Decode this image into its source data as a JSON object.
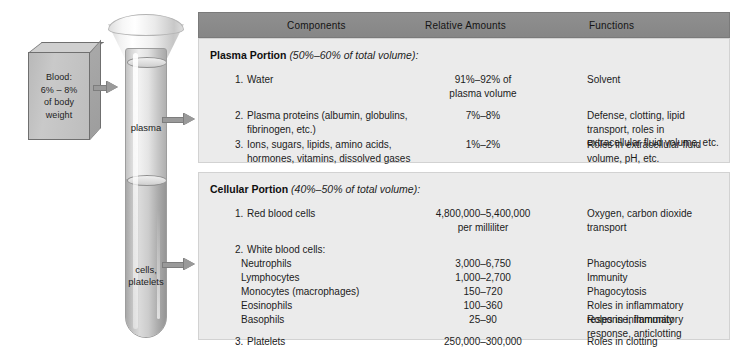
{
  "diagram": {
    "source_box": {
      "name": "blood-source-box",
      "lines": [
        "Blood:",
        "6% – 8%",
        "of body",
        "weight"
      ]
    },
    "tube": {
      "plasma_label": "plasma",
      "cells_label": "cells,\nplatelets"
    },
    "arrows": [
      "arrow-box-to-tube",
      "arrow-plasma-to-table",
      "arrow-cells-to-table"
    ]
  },
  "table": {
    "headers": [
      "Components",
      "Relative Amounts",
      "Functions"
    ],
    "sections": [
      {
        "title_bold": "Plasma Portion",
        "title_italic": "(50%–60% of total volume):",
        "rows": [
          {
            "number": "1.",
            "component": "Water",
            "amount": "91%–92% of\nplasma volume",
            "function": "Solvent"
          },
          {
            "number": "2.",
            "component": "Plasma proteins (albumin, globulins,\nfibrinogen, etc.)",
            "amount": "7%–8%",
            "function": "Defense, clotting, lipid transport, roles in\nextracellular fluid volume, etc."
          },
          {
            "number": "3.",
            "component": "Ions, sugars, lipids, amino acids,\nhormones, vitamins, dissolved gases",
            "amount": "1%–2%",
            "function": "Roles in extracellular fluid volume, pH, etc."
          }
        ]
      },
      {
        "title_bold": "Cellular Portion",
        "title_italic": "(40%–50% of total volume):",
        "rows": [
          {
            "number": "1.",
            "component": "Red blood cells",
            "amount": "4,800,000–5,400,000\nper milliliter",
            "function": "Oxygen, carbon dioxide transport"
          },
          {
            "number": "2.",
            "component": "White blood cells:",
            "amount": "",
            "function": ""
          },
          {
            "number": "",
            "component": "Neutrophils",
            "amount": "3,000–6,750",
            "function": "Phagocytosis",
            "indent": true
          },
          {
            "number": "",
            "component": "Lymphocytes",
            "amount": "1,000–2,700",
            "function": "Immunity",
            "indent": true
          },
          {
            "number": "",
            "component": "Monocytes (macrophages)",
            "amount": "150–720",
            "function": "Phagocytosis",
            "indent": true
          },
          {
            "number": "",
            "component": "Eosinophils",
            "amount": "100–360",
            "function": "Roles in inflammatory response, immunity",
            "indent": true
          },
          {
            "number": "",
            "component": "Basophils",
            "amount": "25–90",
            "function": "Roles in inflammatory response, anticlotting",
            "indent": true
          },
          {
            "number": "3.",
            "component": "Platelets",
            "amount": "250,000–300,000",
            "function": "Roles in clotting"
          }
        ]
      }
    ]
  },
  "colors": {
    "header_bar": "#8b8b8b",
    "section_bg": "#ebebeb",
    "arrow": "#9a9a9a",
    "text": "#1b1b1b"
  }
}
